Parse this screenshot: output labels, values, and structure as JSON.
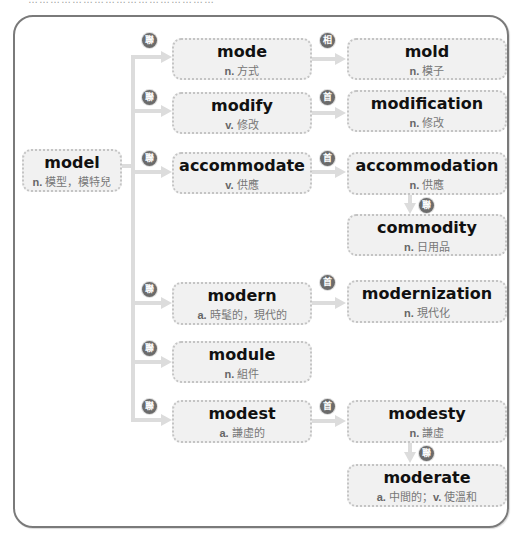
{
  "caption": "……………………………………………",
  "colors": {
    "frame": "#7a7a7a",
    "node_bg": "#f1f1f1",
    "node_border": "#c4c4c4",
    "connector": "#dcdcdc",
    "badge": "#6b6b6b"
  },
  "root": {
    "word": "model",
    "pos": "n.",
    "meaning": "模型，模特兒"
  },
  "branches": [
    {
      "badge": "聯",
      "word": "mode",
      "pos": "n.",
      "meaning": "方式",
      "child": {
        "badge": "相",
        "word": "mold",
        "pos": "n.",
        "meaning": "模子"
      }
    },
    {
      "badge": "聯",
      "word": "modify",
      "pos": "v.",
      "meaning": "修改",
      "child": {
        "badge": "首",
        "word": "modification",
        "pos": "n.",
        "meaning": "修改"
      }
    },
    {
      "badge": "聯",
      "word": "accommodate",
      "pos": "v.",
      "meaning": "供應",
      "child": {
        "badge": "首",
        "word": "accommodation",
        "pos": "n.",
        "meaning": "供應",
        "child": {
          "badge": "聯",
          "word": "commodity",
          "pos": "n.",
          "meaning": "日用品"
        }
      }
    },
    {
      "badge": "聯",
      "word": "modern",
      "pos": "a.",
      "meaning": "時髦的，現代的",
      "child": {
        "badge": "首",
        "word": "modernization",
        "pos": "n.",
        "meaning": "現代化"
      }
    },
    {
      "badge": "聯",
      "word": "module",
      "pos": "n.",
      "meaning": "組件"
    },
    {
      "badge": "聯",
      "word": "modest",
      "pos": "a.",
      "meaning": "謙虛的",
      "child": {
        "badge": "首",
        "word": "modesty",
        "pos": "n.",
        "meaning": "謙虛",
        "child": {
          "badge": "聯",
          "word": "moderate",
          "pos": "a.",
          "meaning": "中間的；",
          "pos2": "v.",
          "meaning2": "使溫和"
        }
      }
    }
  ]
}
